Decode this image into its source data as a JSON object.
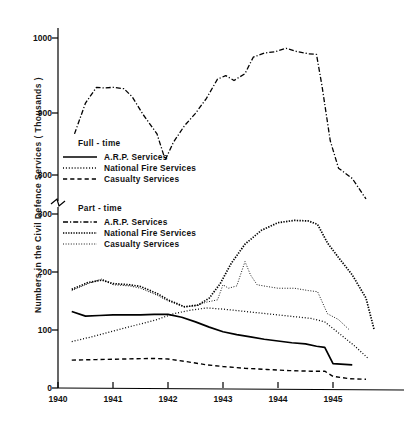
{
  "chart_data": {
    "type": "line",
    "title": "",
    "xlabel": "",
    "ylabel": "Numbers in the Civil Defence Services ( Thousands )",
    "x_tick_labels": [
      "1940",
      "1941",
      "1942",
      "1943",
      "1944",
      "1945"
    ],
    "x_ticks": [
      1940,
      1941,
      1942,
      1943,
      1944,
      1945
    ],
    "xlim": [
      1940,
      1945.75
    ],
    "y_tick_labels_upper": [
      "800",
      "900",
      "1000"
    ],
    "y_tick_labels_lower": [
      "0",
      "100",
      "200",
      "300"
    ],
    "y_ticks_upper": [
      800,
      900,
      1000
    ],
    "y_ticks_lower": [
      0,
      100,
      200,
      300
    ],
    "axis_broken": true,
    "axis_break_between": [
      300,
      800
    ],
    "grid": false,
    "legend_position": "upper-left-inside",
    "series": [
      {
        "name": "Full-time A.R.P. Services",
        "group": "Full-time",
        "style": "solid",
        "x": [
          1940.25,
          1940.5,
          1940.75,
          1941.0,
          1941.25,
          1941.5,
          1941.75,
          1942.0,
          1942.25,
          1942.5,
          1942.75,
          1943.0,
          1943.25,
          1943.5,
          1943.75,
          1944.0,
          1944.25,
          1944.5,
          1944.7,
          1944.85,
          1945.0,
          1945.35
        ],
        "values": [
          132,
          124,
          125,
          126,
          126,
          126,
          127,
          127,
          122,
          114,
          105,
          97,
          92,
          88,
          84,
          81,
          78,
          76,
          72,
          70,
          42,
          40
        ]
      },
      {
        "name": "Full-time National Fire Services",
        "group": "Full-time",
        "style": "dotted",
        "x": [
          1940.25,
          1940.6,
          1941.0,
          1941.4,
          1941.8,
          1942.1,
          1942.4,
          1942.7,
          1943.0,
          1943.4,
          1943.8,
          1944.2,
          1944.6,
          1944.85,
          1945.1,
          1945.4,
          1945.65
        ],
        "values": [
          80,
          88,
          98,
          108,
          118,
          128,
          134,
          138,
          136,
          132,
          128,
          124,
          120,
          114,
          95,
          72,
          50
        ]
      },
      {
        "name": "Full-time Casualty Services",
        "group": "Full-time",
        "style": "dashed",
        "x": [
          1940.25,
          1940.7,
          1941.2,
          1941.7,
          1942.0,
          1942.3,
          1942.7,
          1943.0,
          1943.4,
          1943.8,
          1944.2,
          1944.6,
          1944.85,
          1945.0,
          1945.3,
          1945.6
        ],
        "values": [
          48,
          49,
          50,
          51,
          50,
          46,
          40,
          37,
          34,
          32,
          30,
          29,
          29,
          20,
          16,
          15
        ]
      },
      {
        "name": "Part-time A.R.P. Services",
        "group": "Part-time",
        "style": "dash-dot",
        "x": [
          1940.3,
          1940.5,
          1940.7,
          1940.85,
          1941.0,
          1941.2,
          1941.35,
          1941.55,
          1941.8,
          1941.95,
          1942.1,
          1942.3,
          1942.5,
          1942.7,
          1942.9,
          1943.05,
          1943.2,
          1943.4,
          1943.55,
          1943.75,
          1943.95,
          1944.15,
          1944.35,
          1944.55,
          1944.7,
          1944.8,
          1944.95,
          1945.1,
          1945.35,
          1945.6
        ],
        "values": [
          860,
          905,
          928,
          927,
          928,
          926,
          914,
          888,
          860,
          822,
          848,
          872,
          890,
          912,
          940,
          945,
          938,
          948,
          972,
          978,
          980,
          985,
          980,
          977,
          976,
          930,
          850,
          810,
          795,
          765
        ]
      },
      {
        "name": "Part-time National Fire Services",
        "group": "Part-time",
        "style": "dense-dotted",
        "x": [
          1940.25,
          1940.55,
          1940.8,
          1941.0,
          1941.3,
          1941.5,
          1941.8,
          1942.0,
          1942.3,
          1942.55,
          1942.75,
          1942.95,
          1943.15,
          1943.4,
          1943.7,
          1944.0,
          1944.3,
          1944.55,
          1944.72,
          1944.9,
          1945.1,
          1945.35,
          1945.6,
          1945.75
        ],
        "values": [
          170,
          182,
          186,
          180,
          178,
          175,
          163,
          152,
          140,
          143,
          155,
          180,
          215,
          248,
          272,
          285,
          289,
          288,
          282,
          250,
          225,
          195,
          155,
          100
        ]
      },
      {
        "name": "Part-time Casualty Services",
        "group": "Part-time",
        "style": "fine-dotted",
        "x": [
          1940.25,
          1940.55,
          1940.8,
          1941.0,
          1941.3,
          1941.5,
          1941.8,
          1942.0,
          1942.3,
          1942.5,
          1942.7,
          1942.9,
          1943.0,
          1943.1,
          1943.25,
          1943.4,
          1943.5,
          1943.62,
          1943.8,
          1944.0,
          1944.3,
          1944.55,
          1944.72,
          1944.9,
          1945.1,
          1945.3
        ],
        "values": [
          168,
          180,
          188,
          178,
          176,
          172,
          160,
          150,
          140,
          142,
          148,
          152,
          178,
          172,
          176,
          218,
          195,
          178,
          175,
          172,
          172,
          168,
          166,
          128,
          118,
          100
        ]
      }
    ],
    "annotations": []
  },
  "legends": [
    {
      "heading": "Full - time",
      "entries": [
        {
          "label": "A.R.P. Services",
          "style": "solid"
        },
        {
          "label": "National Fire Services",
          "style": "dotted"
        },
        {
          "label": "Casualty  Services",
          "style": "dashed"
        }
      ]
    },
    {
      "heading": "Part - time",
      "entries": [
        {
          "label": "A.R.P. Services",
          "style": "dash-dot"
        },
        {
          "label": "National Fire Services",
          "style": "dense-dotted"
        },
        {
          "label": "Casualty Services",
          "style": "fine-dotted"
        }
      ]
    }
  ],
  "axes": {
    "y_label": "Numbers in the Civil Defence Services ( Thousands )",
    "y_tick_labels": [
      "1000",
      "900",
      "800",
      "300",
      "200",
      "100",
      "0"
    ],
    "x_tick_labels": [
      "1940",
      "1941",
      "1942",
      "1943",
      "1944",
      "1945"
    ]
  },
  "colors": {
    "ink": "#000000",
    "background": "#ffffff"
  }
}
